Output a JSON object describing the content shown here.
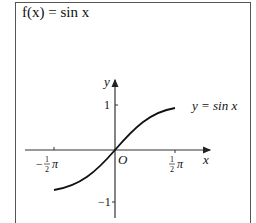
{
  "title": "f(x) = sin x",
  "graph": {
    "curve_label": "y = sin x",
    "x_axis_label": "x",
    "y_axis_label": "y",
    "origin_label": "O",
    "x_ticks": [
      {
        "value": "-π/2",
        "sign": "−",
        "frac_num": "1",
        "frac_den": "2",
        "sym": "π"
      },
      {
        "value": "π/2",
        "sign": "",
        "frac_num": "1",
        "frac_den": "2",
        "sym": "π"
      }
    ],
    "y_ticks": [
      "1",
      "−1"
    ],
    "colors": {
      "curve": "#111111",
      "axes": "#333333"
    }
  }
}
